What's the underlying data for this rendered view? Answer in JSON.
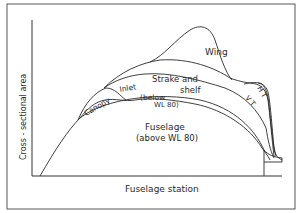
{
  "figure": {
    "type": "area-distribution-diagram",
    "xlabel": "Fuselage station",
    "ylabel": "Cross - sectional area",
    "components": [
      {
        "id": "wing",
        "label": "Wing"
      },
      {
        "id": "strake",
        "label_line1": "Strake and",
        "label_line2": "shelf"
      },
      {
        "id": "inlet",
        "label": "Inlet"
      },
      {
        "id": "below",
        "label_line1": "(below",
        "label_line2": "WL 80)"
      },
      {
        "id": "canopy",
        "label": "Canopy"
      },
      {
        "id": "fuselage",
        "label_line1": "Fuselage",
        "label_line2": "(above WL 80)"
      },
      {
        "id": "vt",
        "label": "V T"
      },
      {
        "id": "ht",
        "label": "H T"
      }
    ],
    "colors": {
      "line": "#2a2a2a",
      "background": "#ffffff"
    }
  }
}
